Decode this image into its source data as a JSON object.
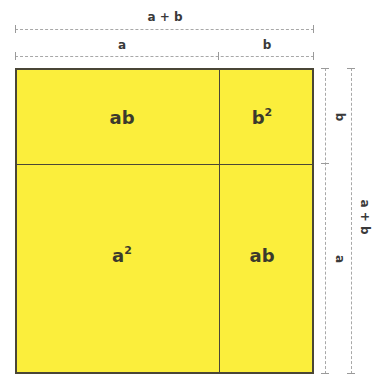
{
  "diagram": {
    "colors": {
      "fill": "#fbee3c",
      "border": "#4a4636",
      "dimension_line": "#a8a8a8",
      "text": "#3b3a2c"
    },
    "top_dimensions": {
      "total_label": "a + b",
      "segment_a_label": "a",
      "segment_b_label": "b"
    },
    "right_dimensions": {
      "total_label": "a + b",
      "segment_b_label": "b",
      "segment_a_label": "a"
    },
    "cells": [
      {
        "position": "top-left",
        "base": "ab",
        "exponent": ""
      },
      {
        "position": "top-right",
        "base": "b",
        "exponent": "2"
      },
      {
        "position": "bottom-left",
        "base": "a",
        "exponent": "2"
      },
      {
        "position": "bottom-right",
        "base": "ab",
        "exponent": ""
      }
    ]
  }
}
